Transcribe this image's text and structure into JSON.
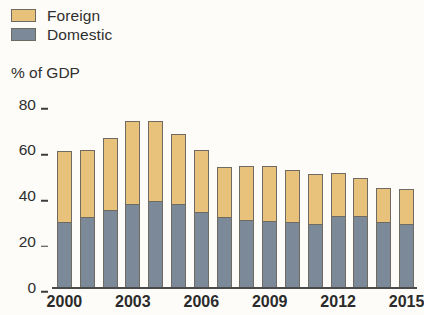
{
  "legend": {
    "items": [
      {
        "label": "Foreign",
        "color": "#e8c17a",
        "key": "foreign"
      },
      {
        "label": "Domestic",
        "color": "#7b8999",
        "key": "domestic"
      }
    ]
  },
  "axis_title": "% of GDP",
  "colors": {
    "foreign": "#e8c17a",
    "domestic": "#7b8999",
    "outline": "#6f6b63",
    "axis": "#4a4a4a",
    "background": "#fdfcf8",
    "text": "#2f2f2f"
  },
  "chart_data": {
    "type": "bar",
    "title": "",
    "subtitle": "",
    "xlabel": "",
    "ylabel": "% of GDP",
    "ylim": [
      0,
      80
    ],
    "yticks": [
      0,
      20,
      40,
      60,
      80
    ],
    "ytick_labels": [
      "0",
      "20",
      "40",
      "60",
      "80"
    ],
    "grid": false,
    "stacked": true,
    "legend_position": "top-left",
    "categories": [
      "2000",
      "2001",
      "2002",
      "2003",
      "2004",
      "2005",
      "2006",
      "2007",
      "2008",
      "2009",
      "2010",
      "2011",
      "2012",
      "2013",
      "2014",
      "2015"
    ],
    "xtick_labels": [
      "2000",
      "2003",
      "2006",
      "2009",
      "2012",
      "2015"
    ],
    "series": [
      {
        "name": "Domestic",
        "color": "#7b8999",
        "values": [
          28.5,
          30.5,
          33.5,
          36.5,
          37.5,
          36.5,
          33,
          30.5,
          29.5,
          29,
          28.5,
          27.5,
          31,
          31,
          28.5,
          27.5
        ]
      },
      {
        "name": "Foreign",
        "color": "#e8c17a",
        "values": [
          31,
          29.5,
          31.5,
          36,
          35,
          30.5,
          27,
          22,
          23.5,
          24,
          22.5,
          22,
          19,
          16.5,
          15,
          15.5
        ]
      }
    ],
    "totals": [
      59.5,
      60,
      65,
      72.5,
      72.5,
      67,
      60,
      52.5,
      53,
      53,
      51,
      49.5,
      50,
      47.5,
      43.5,
      43
    ]
  }
}
